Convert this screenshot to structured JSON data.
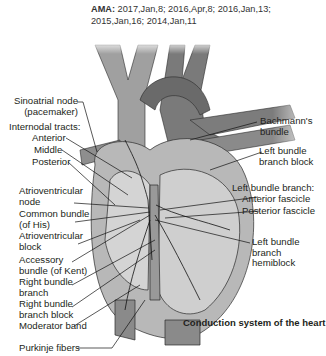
{
  "citation": {
    "prefix": "AMA:",
    "text": "2017,Jan,8; 2016,Apr,8; 2016,Jan,13; 2015,Jan,16; 2014,Jan,11"
  },
  "figure": {
    "caption": "Conduction system of the heart",
    "labels_left": {
      "sa_node_1": "Sinoatrial node",
      "sa_node_2": "(pacemaker)",
      "internodal": "Internodal tracts:",
      "anterior": "Anterior",
      "middle": "Middle",
      "posterior": "Posterior",
      "av_node_1": "Atrioventricular",
      "av_node_2": "node",
      "his_1": "Common bundle",
      "his_2": "(of His)",
      "av_block_1": "Atrioventricular",
      "av_block_2": "block",
      "kent_1": "Accessory",
      "kent_2": "bundle (of Kent)",
      "rbb_1": "Right bundle",
      "rbb_2": "branch",
      "rbbb_1": "Right bundle",
      "rbbb_2": "branch block",
      "moderator": "Moderator band",
      "purkinje": "Purkinje fibers"
    },
    "labels_right": {
      "bachmann_1": "Bachmann's",
      "bachmann_2": "bundle",
      "lbbb_1": "Left bundle",
      "lbbb_2": "branch block",
      "lbb": "Left bundle branch:",
      "ant_fascicle": "Anterior fascicle",
      "post_fascicle": "Posterior fascicle",
      "hemi_1": "Left bundle",
      "hemi_2": "branch",
      "hemi_3": "hemiblock"
    },
    "colors": {
      "vessel_light": "#9a9a9a",
      "vessel_dark": "#6e6e6e",
      "chamber": "#c8c8c8",
      "outline": "#2a2a2a"
    }
  }
}
